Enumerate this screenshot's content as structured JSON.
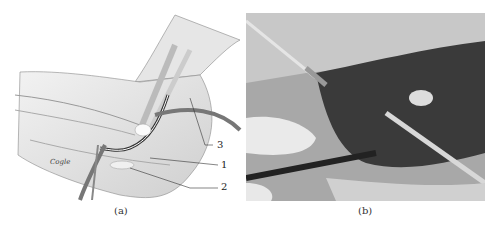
{
  "figure": {
    "panels": [
      {
        "id": "a",
        "caption": "(a)",
        "kind": "anatomical-illustration",
        "description": "Medical illustration of elbow region with exposed nerve, vessels and tendons",
        "signature": "Cogle",
        "labels": [
          {
            "text": "3"
          },
          {
            "text": "1"
          },
          {
            "text": "2"
          }
        ]
      },
      {
        "id": "b",
        "caption": "(b)",
        "kind": "surgical-photograph",
        "description": "Intraoperative photograph with retractor, forceps and probe exposing structure"
      }
    ]
  }
}
